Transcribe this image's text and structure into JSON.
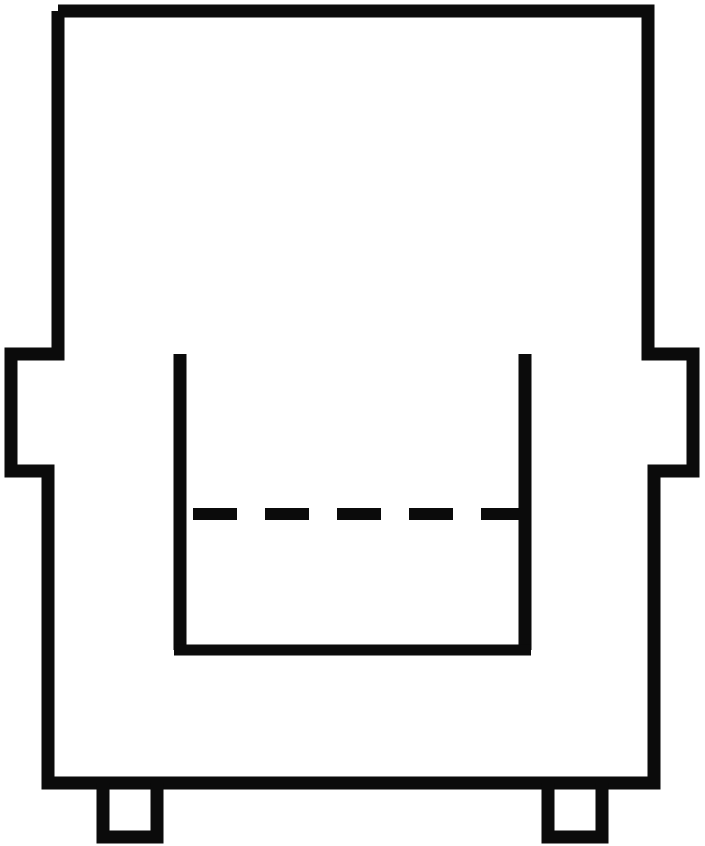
{
  "document": {
    "title": "Armchair Front Elevation Line Drawing",
    "kind": "technical-line-drawing",
    "view": "front elevation",
    "subject": "upholstered armchair",
    "background_color": "#ffffff",
    "ink_color": "#0b0b0b",
    "canvas": {
      "width": 705,
      "height": 846
    }
  },
  "strokes": {
    "outline_width": 13,
    "seat_line_width": 11,
    "leg_width": 13,
    "dash_width": 12
  },
  "geometry": {
    "body_outline_points": "58,11 648,11 648,354 693,354 693,471 654,471 654,783 48,783 48,471 11,471 11,354 58,354 58,11",
    "backrest": {
      "left": 58,
      "right": 648,
      "top": 11,
      "bottom": 354,
      "label": "backrest"
    },
    "left_armrest": {
      "outer_x": 11,
      "inner_x": 180,
      "top_y": 354,
      "notch_y": 471,
      "notch_outer_x": 48,
      "label": "left armrest"
    },
    "right_armrest": {
      "outer_x": 693,
      "inner_x": 525,
      "top_y": 354,
      "notch_y": 471,
      "notch_outer_x": 654,
      "label": "right armrest"
    },
    "seat_recess": {
      "left_x": 180,
      "right_x": 525,
      "bottom_y": 650,
      "label": "seat recess"
    },
    "base": {
      "left": 48,
      "right": 654,
      "bottom_y": 783,
      "label": "base / skirt"
    },
    "legs": [
      {
        "name": "left-leg",
        "x": 103,
        "y": 783,
        "width": 54,
        "height": 54
      },
      {
        "name": "right-leg",
        "x": 548,
        "y": 783,
        "width": 54,
        "height": 54
      }
    ],
    "cushion_dashed_line": {
      "y": 514,
      "x_start": 193,
      "x_end": 521,
      "dash_count": 5,
      "dash_length": 44,
      "gap_length": 28,
      "label": "seat cushion line (hidden edge)"
    }
  }
}
